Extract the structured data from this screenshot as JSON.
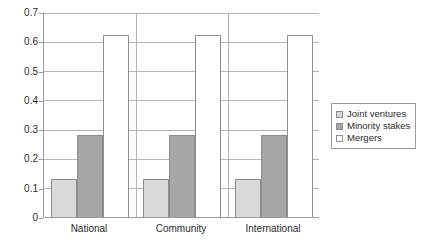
{
  "chart_data": {
    "type": "bar",
    "title": "",
    "subtitle": "",
    "xlabel": "",
    "ylabel": "",
    "categories": [
      "National",
      "Community",
      "International"
    ],
    "series": [
      {
        "name": "Joint ventures",
        "values": [
          0.13,
          0.13,
          0.13
        ],
        "color": "#d9d9d9"
      },
      {
        "name": "Minority stakes",
        "values": [
          0.28,
          0.28,
          0.28
        ],
        "color": "#a6a6a6"
      },
      {
        "name": "Mergers",
        "values": [
          0.62,
          0.62,
          0.62
        ],
        "color": "#ffffff"
      }
    ],
    "ylim": [
      0,
      0.7
    ],
    "ytick_values": [
      0,
      0.1,
      0.2,
      0.3,
      0.4,
      0.5,
      0.6,
      0.7
    ],
    "ytick_labels": [
      "0",
      "0.1",
      "0.2",
      "0.3",
      "0.4",
      "0.5",
      "0.6",
      "0.7"
    ],
    "grid": {
      "horizontal": true,
      "vertical": false
    },
    "legend": {
      "position": "right",
      "entries": [
        "Joint ventures",
        "Minority stakes",
        "Mergers"
      ]
    },
    "annotations": []
  },
  "colors": {
    "axis": "#9a9a9a",
    "grid": "#b4b4b4",
    "bar_border": "#8c8c8c",
    "text": "#2b2b2b",
    "background": "#ffffff"
  }
}
